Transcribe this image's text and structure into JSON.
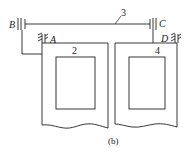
{
  "diagram": {
    "caption": "(b)",
    "labels": {
      "B": "B",
      "A": "A",
      "C": "C",
      "D": "D",
      "shaft": "3",
      "left_block": "2",
      "right_block": "4"
    },
    "colors": {
      "stroke": "#222222",
      "background": "#ffffff"
    }
  }
}
